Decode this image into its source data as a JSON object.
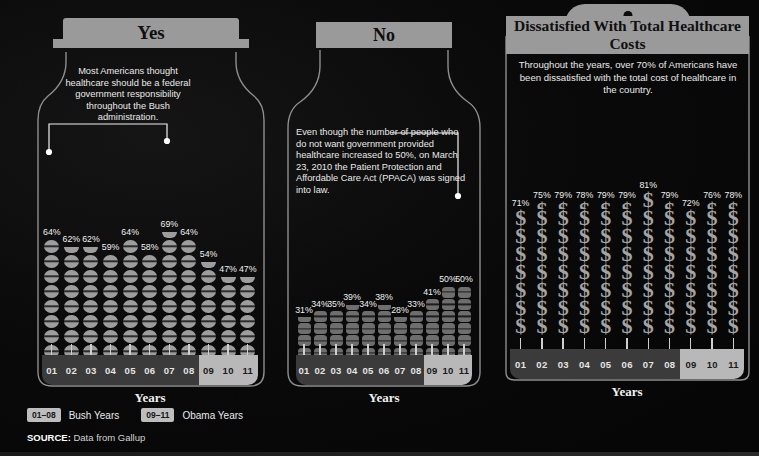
{
  "panels": {
    "yes": {
      "header": "Yes",
      "callout": "Most Americans thought healthcare should be a federal government responsibility throughout the Bush administration.",
      "axis_label": "Years"
    },
    "no": {
      "header": "No",
      "callout": "Even though the number of people who do not want government provided healthcare increased to 50%, on March 23, 2010 the Patient Protection and Affordable Care Act (PPACA) was signed into law.",
      "axis_label": "Years"
    },
    "cost": {
      "header": "Dissatisfied With Total Healthcare Costs",
      "callout": "Throughout the years, over 70% of Americans have been dissatisfied with the total cost of healthcare in the country.",
      "axis_label": "Years"
    }
  },
  "legend": {
    "bush_chip": "01–08",
    "bush_label": "Bush Years",
    "obama_chip": "09–11",
    "obama_label": "Obama Years"
  },
  "source": {
    "prefix": "SOURCE:",
    "text": "Data from Gallup"
  },
  "colors": {
    "background": "#070707",
    "banner": "#9a9a9a",
    "pill": "#9d9d9d",
    "tablet": "#6e6e6e",
    "dollar": "#a4a4a4",
    "axis_bush": "#3b3b3b",
    "axis_obama": "#b8b8b8"
  },
  "chart_data": [
    {
      "type": "bar",
      "title": "Yes",
      "subtitle": "Healthcare should be a federal government responsibility",
      "xlabel": "Years",
      "ylabel": "Percent",
      "unit": "%",
      "icon": "pill",
      "ylim": [
        0,
        100
      ],
      "categories": [
        "01",
        "02",
        "03",
        "04",
        "05",
        "06",
        "07",
        "08",
        "09",
        "10",
        "11"
      ],
      "values": [
        64,
        62,
        62,
        59,
        64,
        58,
        69,
        64,
        54,
        47,
        47
      ],
      "labels": [
        "64%",
        "62%",
        "62%",
        "59%",
        "64%",
        "58%",
        "69%",
        "64%",
        "54%",
        "47%",
        "47%"
      ]
    },
    {
      "type": "bar",
      "title": "No",
      "subtitle": "Do not want government provided healthcare",
      "xlabel": "Years",
      "ylabel": "Percent",
      "unit": "%",
      "icon": "tablet",
      "ylim": [
        0,
        100
      ],
      "categories": [
        "01",
        "02",
        "03",
        "04",
        "05",
        "06",
        "07",
        "08",
        "09",
        "10",
        "11"
      ],
      "values": [
        31,
        34,
        35,
        39,
        34,
        38,
        28,
        33,
        41,
        50,
        50
      ],
      "labels": [
        "31%",
        "34%",
        "35%",
        "39%",
        "34%",
        "38%",
        "28%",
        "33%",
        "41%",
        "50%",
        "50%"
      ]
    },
    {
      "type": "bar",
      "title": "Dissatisfied With Total Healthcare Costs",
      "subtitle": "Dissatisfied with the total cost of healthcare",
      "xlabel": "Years",
      "ylabel": "Percent",
      "unit": "%",
      "icon": "dollar",
      "ylim": [
        0,
        100
      ],
      "categories": [
        "01",
        "02",
        "03",
        "04",
        "05",
        "06",
        "07",
        "08",
        "09",
        "10",
        "11"
      ],
      "values": [
        71,
        75,
        79,
        78,
        79,
        79,
        81,
        79,
        72,
        76,
        78
      ],
      "labels": [
        "71%",
        "75%",
        "79%",
        "78%",
        "79%",
        "79%",
        "81%",
        "79%",
        "72%",
        "76%",
        "78%"
      ]
    }
  ]
}
